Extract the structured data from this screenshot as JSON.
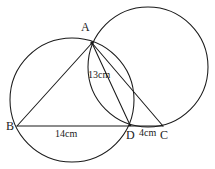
{
  "figure": {
    "kind": "geometry-diagram",
    "width": 215,
    "height": 169,
    "background_color": "#ffffff",
    "stroke_color": "#1a1a1a",
    "text_color": "#1a1a1a"
  },
  "labels": {
    "vertex_a": "A",
    "vertex_b": "B",
    "vertex_c": "C",
    "vertex_d": "D",
    "measure_ad": "13cm",
    "measure_bd": "14cm",
    "measure_dc": "4cm"
  },
  "chart_data": {
    "type": "diagram",
    "title": "",
    "points": [
      {
        "name": "A",
        "x": 92,
        "y": 43,
        "label": "A"
      },
      {
        "name": "B",
        "x": 17,
        "y": 126,
        "label": "B"
      },
      {
        "name": "D",
        "x": 130,
        "y": 125,
        "label": "D"
      },
      {
        "name": "C",
        "x": 163,
        "y": 126,
        "label": "C"
      }
    ],
    "segments": [
      {
        "name": "AB",
        "from": "A",
        "to": "B"
      },
      {
        "name": "BC",
        "from": "B",
        "to": "C"
      },
      {
        "name": "AD",
        "from": "A",
        "to": "D",
        "length_label": "13cm"
      },
      {
        "name": "AC",
        "from": "A",
        "to": "C"
      }
    ],
    "circles": [
      {
        "name": "circumcircle-ABD",
        "cx": 72,
        "cy": 100,
        "r": 62,
        "through": [
          "A",
          "B",
          "D"
        ]
      },
      {
        "name": "circle-ADC",
        "cx": 148,
        "cy": 67,
        "r": 60,
        "through": [
          "A",
          "D",
          "C"
        ]
      }
    ],
    "measurements": [
      {
        "segment": "AD",
        "value": 13,
        "unit": "cm",
        "text": "13cm"
      },
      {
        "segment": "BD",
        "value": 14,
        "unit": "cm",
        "text": "14cm"
      },
      {
        "segment": "DC",
        "value": 4,
        "unit": "cm",
        "text": "4cm"
      }
    ]
  }
}
